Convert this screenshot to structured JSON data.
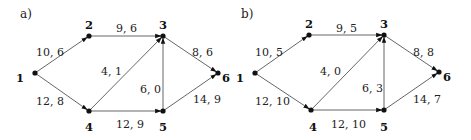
{
  "graphs": [
    {
      "id": "a",
      "panel_label": "a)",
      "offset_x": 0,
      "panel_label_pos": [
        20,
        18
      ],
      "nodes": [
        {
          "id": "1",
          "label": "1",
          "x": 35,
          "y": 73,
          "lx": 20,
          "ly": 82
        },
        {
          "id": "2",
          "label": "2",
          "x": 89,
          "y": 36,
          "lx": 89,
          "ly": 29
        },
        {
          "id": "3",
          "label": "3",
          "x": 163,
          "y": 36,
          "lx": 163,
          "ly": 29
        },
        {
          "id": "4",
          "label": "4",
          "x": 89,
          "y": 111,
          "lx": 89,
          "ly": 131
        },
        {
          "id": "5",
          "label": "5",
          "x": 163,
          "y": 111,
          "lx": 163,
          "ly": 131
        },
        {
          "id": "6",
          "label": "6",
          "x": 218,
          "y": 73,
          "lx": 226,
          "ly": 82
        }
      ],
      "edges": [
        {
          "from": "1",
          "to": "2",
          "label": "10, 6",
          "lx": 36,
          "ly": 56
        },
        {
          "from": "1",
          "to": "4",
          "label": "12, 8",
          "lx": 36,
          "ly": 105
        },
        {
          "from": "2",
          "to": "3",
          "label": "9, 6",
          "lx": 116,
          "ly": 32
        },
        {
          "from": "4",
          "to": "3",
          "label": "4, 1",
          "lx": 101,
          "ly": 75
        },
        {
          "from": "4",
          "to": "5",
          "label": "12, 9",
          "lx": 116,
          "ly": 128
        },
        {
          "from": "5",
          "to": "3",
          "label": "6, 0",
          "lx": 140,
          "ly": 93
        },
        {
          "from": "3",
          "to": "6",
          "label": "8, 6",
          "lx": 192,
          "ly": 56
        },
        {
          "from": "5",
          "to": "6",
          "label": "14, 9",
          "lx": 193,
          "ly": 103
        }
      ]
    },
    {
      "id": "b",
      "panel_label": "b)",
      "offset_x": 0,
      "panel_label_pos": [
        241,
        18
      ],
      "nodes": [
        {
          "id": "1",
          "label": "1",
          "x": 255,
          "y": 73,
          "lx": 240,
          "ly": 82
        },
        {
          "id": "2",
          "label": "2",
          "x": 309,
          "y": 35,
          "lx": 309,
          "ly": 28
        },
        {
          "id": "3",
          "label": "3",
          "x": 384,
          "y": 35,
          "lx": 384,
          "ly": 28
        },
        {
          "id": "4",
          "label": "4",
          "x": 311,
          "y": 110,
          "lx": 313,
          "ly": 131
        },
        {
          "id": "5",
          "label": "5",
          "x": 384,
          "y": 110,
          "lx": 384,
          "ly": 131
        },
        {
          "id": "6",
          "label": "6",
          "x": 439,
          "y": 72,
          "lx": 447,
          "ly": 81
        },
        {
          "id": "6b",
          "label": "",
          "x": 0,
          "y": 0,
          "lx": 0,
          "ly": 0,
          "hidden": true
        }
      ],
      "edges": [
        {
          "from": "1",
          "to": "2",
          "label": "10, 5",
          "lx": 255,
          "ly": 56
        },
        {
          "from": "1",
          "to": "4",
          "label": "12, 10",
          "lx": 255,
          "ly": 105
        },
        {
          "from": "2",
          "to": "3",
          "label": "9, 5",
          "lx": 336,
          "ly": 32
        },
        {
          "from": "4",
          "to": "3",
          "label": "4, 0",
          "lx": 320,
          "ly": 75
        },
        {
          "from": "4",
          "to": "5",
          "label": "12, 10",
          "lx": 331,
          "ly": 128
        },
        {
          "from": "5",
          "to": "3",
          "label": "6, 3",
          "lx": 362,
          "ly": 92
        },
        {
          "from": "3",
          "to": "6",
          "label": "8, 8",
          "lx": 413,
          "ly": 56
        },
        {
          "from": "5",
          "to": "6",
          "label": "14, 7",
          "lx": 413,
          "ly": 103
        }
      ]
    }
  ]
}
